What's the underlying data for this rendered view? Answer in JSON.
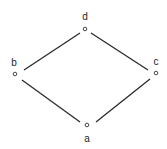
{
  "diagram": {
    "type": "hasse-diagram",
    "nodes": [
      {
        "id": "d",
        "label": "d",
        "x": 85,
        "y": 29,
        "label_x": 85,
        "label_y": 20
      },
      {
        "id": "b",
        "label": "b",
        "x": 15,
        "y": 74,
        "label_x": 14,
        "label_y": 66
      },
      {
        "id": "c",
        "label": "c",
        "x": 156,
        "y": 73,
        "label_x": 156,
        "label_y": 65
      },
      {
        "id": "a",
        "label": "a",
        "x": 87,
        "y": 125,
        "label_x": 87,
        "label_y": 142
      }
    ],
    "edges": [
      {
        "from": "d",
        "to": "b",
        "x1": 80,
        "y1": 33,
        "x2": 24,
        "y2": 70
      },
      {
        "from": "d",
        "to": "c",
        "x1": 91,
        "y1": 33,
        "x2": 148,
        "y2": 70
      },
      {
        "from": "b",
        "to": "a",
        "x1": 22,
        "y1": 80,
        "x2": 80,
        "y2": 122
      },
      {
        "from": "c",
        "to": "a",
        "x1": 150,
        "y1": 79,
        "x2": 96,
        "y2": 122
      }
    ]
  }
}
